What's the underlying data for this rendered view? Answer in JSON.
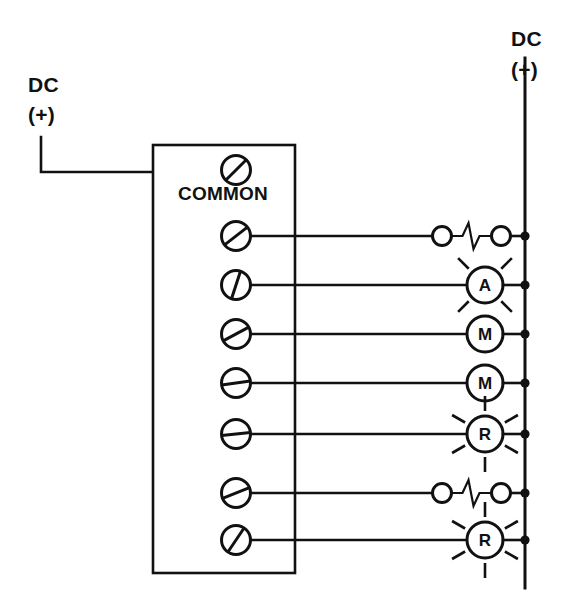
{
  "diagram": {
    "type": "electrical-schematic",
    "background_color": "#ffffff",
    "line_color": "#111111"
  },
  "supply_left": {
    "line1": "DC",
    "line2": "(+)",
    "description": "DC positive supply feeding COMMON terminal"
  },
  "supply_right": {
    "line1": "DC",
    "line2": "(+)",
    "description": "DC positive bus rail on right side"
  },
  "terminal_block": {
    "common_label": "COMMON",
    "terminal_count": 7,
    "common_terminal": {
      "name": "common-terminal",
      "slot_angle_deg": -42
    },
    "terminals": [
      {
        "index": 1,
        "slot_angle_deg": -38,
        "device": "fuse-1"
      },
      {
        "index": 2,
        "slot_angle_deg": -72,
        "device": "lamp-a"
      },
      {
        "index": 3,
        "slot_angle_deg": -28,
        "device": "motor-m1"
      },
      {
        "index": 4,
        "slot_angle_deg": -8,
        "device": "motor-m2"
      },
      {
        "index": 5,
        "slot_angle_deg": -6,
        "device": "lamp-r1"
      },
      {
        "index": 6,
        "slot_angle_deg": -22,
        "device": "fuse-2"
      },
      {
        "index": 7,
        "slot_angle_deg": -56,
        "device": "lamp-r2"
      }
    ]
  },
  "devices": [
    {
      "id": "fuse-1",
      "row": 1,
      "kind": "fuse",
      "letter": "",
      "rays": 0,
      "name": "fuse-heater-row-1"
    },
    {
      "id": "lamp-a",
      "row": 2,
      "kind": "lamp",
      "letter": "A",
      "rays": 4,
      "name": "indicator-lamp-a"
    },
    {
      "id": "motor-m1",
      "row": 3,
      "kind": "motor",
      "letter": "M",
      "rays": 0,
      "name": "motor-starter-m1"
    },
    {
      "id": "motor-m2",
      "row": 4,
      "kind": "motor",
      "letter": "M",
      "rays": 0,
      "name": "motor-starter-m2"
    },
    {
      "id": "lamp-r1",
      "row": 5,
      "kind": "lamp",
      "letter": "R",
      "rays": 6,
      "name": "indicator-lamp-r1"
    },
    {
      "id": "fuse-2",
      "row": 6,
      "kind": "fuse",
      "letter": "",
      "rays": 0,
      "name": "fuse-heater-row-6"
    },
    {
      "id": "lamp-r2",
      "row": 7,
      "kind": "lamp",
      "letter": "R",
      "rays": 6,
      "name": "indicator-lamp-r2"
    }
  ],
  "junction_count": 7
}
